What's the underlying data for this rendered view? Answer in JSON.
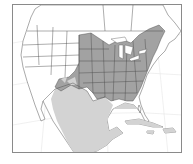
{
  "map": {
    "subject": "Species range map of North America",
    "region": "North America, Central America and Caribbean",
    "colors": {
      "background": "#ffffff",
      "land": "#ffffff",
      "range_primary": "#a2a2a2",
      "range_secondary": "#d3d3d3",
      "borders": "#4a4a4a",
      "frame": "#8a8a8a"
    },
    "layers": [
      {
        "name": "range-primary",
        "description": "darker shaded range: eastern and central United States and southern Canada",
        "color": "#a2a2a2"
      },
      {
        "name": "range-secondary",
        "description": "lighter shaded range: southwestern US, Mexico, Central America, Caribbean",
        "color": "#d3d3d3"
      }
    ]
  }
}
